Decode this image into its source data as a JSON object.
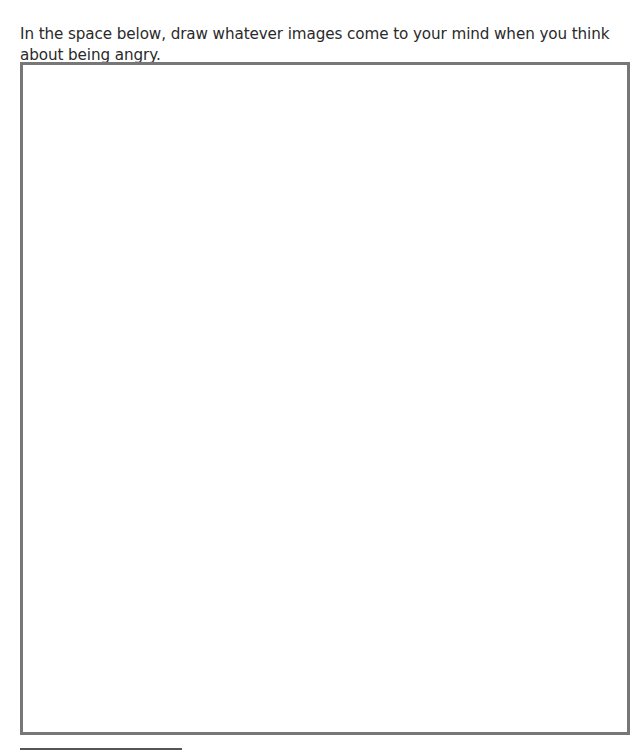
{
  "worksheet": {
    "prompt": "In the space below, draw whatever images come to your mind when you think about being angry.",
    "drawing_area": {
      "border_color": "#777777",
      "content": ""
    },
    "footnote_rule_color": "#555555"
  }
}
